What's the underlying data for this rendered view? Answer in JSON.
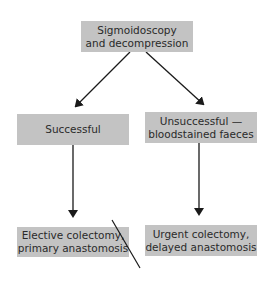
{
  "diagram": {
    "type": "flowchart",
    "colors": {
      "box_fill": "#c3c3c3",
      "text": "#2a2a2a",
      "arrow": "#1a1a1a",
      "background": "#ffffff"
    },
    "nodes": {
      "start": {
        "line1": "Sigmoidoscopy",
        "line2": "and decompression"
      },
      "successful": {
        "line1": "Successful"
      },
      "unsuccessful": {
        "line1": "Unsuccessful —",
        "line2": "bloodstained faeces"
      },
      "elective": {
        "line1": "Elective colectomy,",
        "line2": "primary anastomosis"
      },
      "urgent": {
        "line1": "Urgent colectomy,",
        "line2": "delayed anastomosis"
      }
    },
    "edges": [
      {
        "from": "start",
        "to": "successful"
      },
      {
        "from": "start",
        "to": "unsuccessful"
      },
      {
        "from": "successful",
        "to": "elective"
      },
      {
        "from": "unsuccessful",
        "to": "urgent"
      }
    ]
  }
}
